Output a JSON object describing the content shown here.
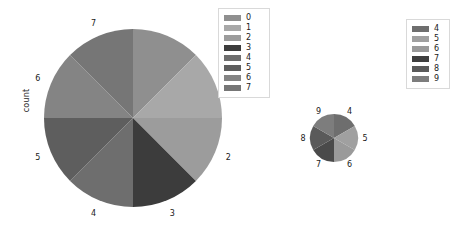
{
  "figure": {
    "background": "#ffffff",
    "axis_label": "count"
  },
  "chart_data": [
    {
      "type": "pie",
      "name": "large-pie",
      "title": "",
      "xlabel": "",
      "ylabel": "count",
      "grid": false,
      "legend_position": "upper-right",
      "start_angle": 90,
      "direction": "clockwise",
      "labels": [
        "0",
        "1",
        "2",
        "3",
        "4",
        "5",
        "6",
        "7"
      ],
      "outside_labels": [
        "1",
        "2",
        "3",
        "4",
        "5",
        "6",
        "7"
      ],
      "values": [
        12.5,
        12.5,
        12.5,
        12.5,
        12.5,
        12.5,
        12.5,
        12.5
      ],
      "fractions": [
        0.125,
        0.125,
        0.125,
        0.125,
        0.125,
        0.125,
        0.125,
        0.125
      ],
      "colors": [
        "#8f8f8f",
        "#a8a8a8",
        "#9c9c9c",
        "#3c3c3c",
        "#6e6e6e",
        "#5e5e5e",
        "#848484",
        "#767676"
      ],
      "legend": {
        "items": [
          {
            "label": "0",
            "color": "#8f8f8f"
          },
          {
            "label": "1",
            "color": "#a8a8a8"
          },
          {
            "label": "2",
            "color": "#9c9c9c"
          },
          {
            "label": "3",
            "color": "#3c3c3c"
          },
          {
            "label": "4",
            "color": "#6e6e6e"
          },
          {
            "label": "5",
            "color": "#5e5e5e"
          },
          {
            "label": "6",
            "color": "#848484"
          },
          {
            "label": "7",
            "color": "#767676"
          }
        ]
      }
    },
    {
      "type": "pie",
      "name": "small-pie",
      "title": "",
      "xlabel": "",
      "ylabel": "",
      "grid": false,
      "legend_position": "right",
      "start_angle": 90,
      "direction": "clockwise",
      "labels": [
        "4",
        "5",
        "6",
        "7",
        "8",
        "9"
      ],
      "outside_labels": [
        "4",
        "5",
        "6",
        "7",
        "8",
        "9"
      ],
      "values": [
        16.67,
        16.67,
        16.67,
        16.67,
        16.67,
        16.67
      ],
      "fractions": [
        0.1667,
        0.1667,
        0.1667,
        0.1667,
        0.1667,
        0.1667
      ],
      "colors": [
        "#6e6e6e",
        "#a0a0a0",
        "#9a9a9a",
        "#4a4a4a",
        "#5a5a5a",
        "#7d7d7d"
      ],
      "legend": {
        "items": [
          {
            "label": "4",
            "color": "#6e6e6e"
          },
          {
            "label": "5",
            "color": "#a0a0a0"
          },
          {
            "label": "6",
            "color": "#9a9a9a"
          },
          {
            "label": "7",
            "color": "#3f3f3f"
          },
          {
            "label": "8",
            "color": "#5a5a5a"
          },
          {
            "label": "9",
            "color": "#7d7d7d"
          }
        ]
      }
    }
  ]
}
